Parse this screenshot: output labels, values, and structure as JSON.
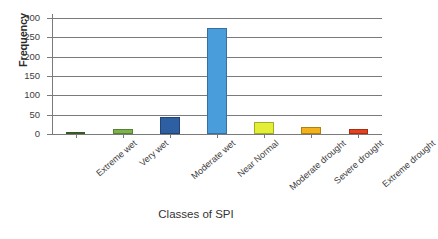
{
  "chart_data": {
    "type": "bar",
    "title": "",
    "xlabel": "Classes of SPI",
    "ylabel": "Frequency",
    "categories": [
      "Extreme wet",
      "Very wet",
      "Moderate wet",
      "Near Normal",
      "Moderate drought",
      "Severe drought",
      "Extreme drought"
    ],
    "values": [
      3,
      12,
      45,
      273,
      32,
      19,
      14
    ],
    "colors": [
      "#4e7a35",
      "#7cb34a",
      "#2e5fa3",
      "#4a9ddb",
      "#e2ef36",
      "#f3b21c",
      "#e8411d"
    ],
    "ylim": [
      0,
      300
    ],
    "yticks": [
      0,
      50,
      100,
      150,
      200,
      250,
      300
    ],
    "ytick_labels": [
      "0",
      "50",
      "100",
      "150",
      "200",
      "250",
      "300"
    ],
    "grid": "horizontal",
    "legend": "none",
    "axis_color": "#7a7a7a",
    "background": "#ffffff"
  }
}
